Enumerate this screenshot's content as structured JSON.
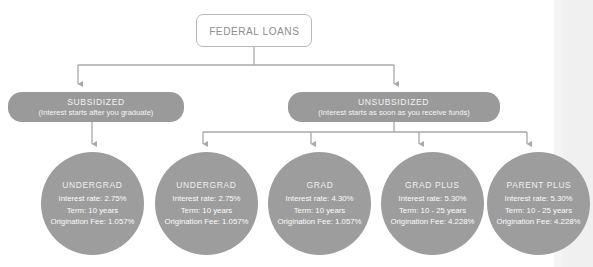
{
  "diagram": {
    "title": "FEDERAL LOANS",
    "root": {
      "label": "FEDERAL LOANS"
    },
    "categories": [
      {
        "id": "subsidized",
        "title": "SUBSIDIZED",
        "subtitle": "(Interest starts after you graduate)"
      },
      {
        "id": "unsubsidized",
        "title": "UNSUBSIDIZED",
        "subtitle": "(Interest starts as soon as you receive funds)"
      }
    ],
    "loans": [
      {
        "id": "undergrad-subsidized",
        "name": "UNDERGRAD",
        "interest_rate": "Interest rate: 2.75%",
        "term": "Term: 10 years",
        "origination_fee": "Origination Fee: 1.057%"
      },
      {
        "id": "undergrad-unsubsidized",
        "name": "UNDERGRAD",
        "interest_rate": "Interest rate: 2.75%",
        "term": "Term: 10 years",
        "origination_fee": "Origination Fee: 1.057%"
      },
      {
        "id": "grad",
        "name": "GRAD",
        "interest_rate": "Interest rate: 4.30%",
        "term": "Term: 10 years",
        "origination_fee": "Origination Fee: 1.057%"
      },
      {
        "id": "grad-plus",
        "name": "GRAD PLUS",
        "interest_rate": "Interest rate: 5.30%",
        "term": "Term: 10 - 25 years",
        "origination_fee": "Origination Fee: 4.228%"
      },
      {
        "id": "parent-plus",
        "name": "PARENT PLUS",
        "interest_rate": "Interest rate: 5.30%",
        "term": "Term: 10 - 25 years",
        "origination_fee": "Origination Fee: 4.228%"
      }
    ],
    "colors": {
      "node_fill": "#9a9a9a",
      "circle_fill": "#9d9d9d",
      "connector": "#a8a8a8",
      "root_border": "#b9b9b9",
      "root_text": "#8e8e8e",
      "node_text": "#ffffff",
      "background": "#ffffff"
    }
  }
}
